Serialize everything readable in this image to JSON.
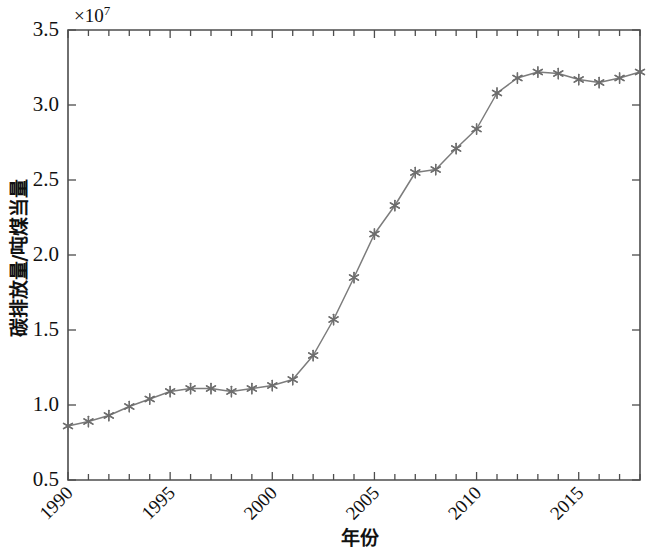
{
  "chart_data": {
    "type": "line",
    "title": "",
    "subtitle": "",
    "xlabel": "年份",
    "ylabel": "碳排放量/吨煤当量",
    "y_multiplier_label": "×10",
    "y_multiplier_exponent": "7",
    "y_axis_scale": 10000000.0,
    "xlim": [
      1990,
      2018
    ],
    "ylim": [
      0.5,
      3.5
    ],
    "xticks": [
      1990,
      1995,
      2000,
      2005,
      2010,
      2015
    ],
    "xtick_labels": [
      "1990",
      "1995",
      "2000",
      "2005",
      "2010",
      "2015"
    ],
    "xtick_minor_step": 1,
    "yticks": [
      0.5,
      1.0,
      1.5,
      2.0,
      2.5,
      3.0,
      3.5
    ],
    "ytick_labels": [
      "0.5",
      "1.0",
      "1.5",
      "2.0",
      "2.5",
      "3.0",
      "3.5"
    ],
    "grid": false,
    "legend": null,
    "legend_position": "none",
    "line_color": "#7c7c7c",
    "marker_color": "#6e6e6e",
    "marker_style": "asterisk",
    "axis_color": "#4d4d4d",
    "background_color": "#ffffff",
    "x": [
      1990,
      1991,
      1992,
      1993,
      1994,
      1995,
      1996,
      1997,
      1998,
      1999,
      2000,
      2001,
      2002,
      2003,
      2004,
      2005,
      2006,
      2007,
      2008,
      2009,
      2010,
      2011,
      2012,
      2013,
      2014,
      2015,
      2016,
      2017,
      2018
    ],
    "values": [
      0.86,
      0.89,
      0.93,
      0.99,
      1.04,
      1.09,
      1.11,
      1.11,
      1.09,
      1.11,
      1.13,
      1.17,
      1.33,
      1.57,
      1.85,
      2.14,
      2.33,
      2.55,
      2.57,
      2.71,
      2.84,
      3.08,
      3.18,
      3.22,
      3.21,
      3.17,
      3.15,
      3.18,
      3.22
    ],
    "series": [
      {
        "name": "碳排放量",
        "values": [
          0.86,
          0.89,
          0.93,
          0.99,
          1.04,
          1.09,
          1.11,
          1.11,
          1.09,
          1.11,
          1.13,
          1.17,
          1.33,
          1.57,
          1.85,
          2.14,
          2.33,
          2.55,
          2.57,
          2.71,
          2.84,
          3.08,
          3.18,
          3.22,
          3.21,
          3.17,
          3.15,
          3.18,
          3.22
        ]
      }
    ]
  }
}
